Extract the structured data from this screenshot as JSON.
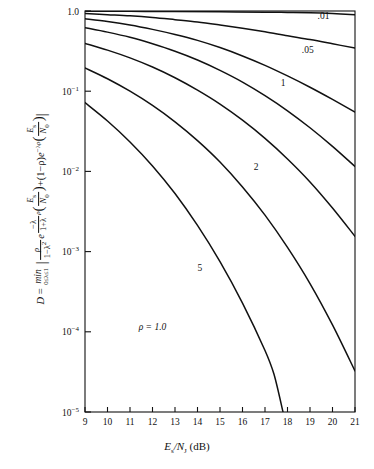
{
  "chart_data": {
    "type": "line",
    "title": "",
    "xlabel": "Es/NJ (dB)",
    "ylabel": "D = min 0<=lambda<=1 | rho/(1-lambda^2) e^{-(lambda/(1+lambda)) rho (Es/N0)} + (1-rho) e^{-lambda rho (Es/N0)} |",
    "xscale": "linear",
    "yscale": "log",
    "xlim": [
      9,
      21
    ],
    "ylim": [
      1e-05,
      1.0
    ],
    "grid": false,
    "legend_position": "inline-curve-labels",
    "xticks": [
      9,
      10,
      11,
      12,
      13,
      14,
      15,
      16,
      17,
      18,
      19,
      20,
      21
    ],
    "xticklabels": [
      "9",
      "10",
      "11",
      "12",
      "13",
      "14",
      "15",
      "16",
      "17",
      "18",
      "19",
      "20",
      "21"
    ],
    "yticks": [
      1.0,
      0.1,
      0.01,
      0.001,
      0.0001,
      1e-05
    ],
    "yticklabels": [
      "1.0",
      "10-1",
      "10-2",
      "10-3",
      "10-4",
      "10-5"
    ],
    "parameter_symbol": "rho",
    "series": [
      {
        "name": "top",
        "label": "",
        "rho": null,
        "points": [
          [
            9,
            0.995
          ],
          [
            11,
            0.99
          ],
          [
            13,
            0.985
          ],
          [
            15,
            0.978
          ],
          [
            17,
            0.968
          ],
          [
            18,
            0.96
          ],
          [
            19,
            0.95
          ],
          [
            20,
            0.93
          ],
          [
            21,
            0.9
          ]
        ]
      },
      {
        "name": ".01",
        "label": ".01",
        "rho": 0.01,
        "label_x": 19.6,
        "label_y": 0.8,
        "points": [
          [
            9,
            0.93
          ],
          [
            10,
            0.9
          ],
          [
            11,
            0.87
          ],
          [
            12,
            0.83
          ],
          [
            13,
            0.78
          ],
          [
            14,
            0.73
          ],
          [
            15,
            0.67
          ],
          [
            16,
            0.61
          ],
          [
            17,
            0.55
          ],
          [
            18,
            0.49
          ],
          [
            19,
            0.44
          ],
          [
            20,
            0.39
          ],
          [
            21,
            0.345
          ]
        ]
      },
      {
        "name": ".05",
        "label": ".05",
        "rho": 0.05,
        "label_x": 18.9,
        "label_y": 0.3,
        "points": [
          [
            9,
            0.8
          ],
          [
            10,
            0.74
          ],
          [
            11,
            0.67
          ],
          [
            12,
            0.59
          ],
          [
            13,
            0.51
          ],
          [
            14,
            0.43
          ],
          [
            15,
            0.35
          ],
          [
            16,
            0.275
          ],
          [
            17,
            0.21
          ],
          [
            18,
            0.155
          ],
          [
            19,
            0.112
          ],
          [
            20,
            0.079
          ],
          [
            21,
            0.055
          ]
        ]
      },
      {
        "name": ".1",
        "label": "1",
        "rho": 0.1,
        "label_x": 17.8,
        "label_y": 0.115,
        "points": [
          [
            9,
            0.62
          ],
          [
            10,
            0.545
          ],
          [
            11,
            0.47
          ],
          [
            12,
            0.39
          ],
          [
            13,
            0.315
          ],
          [
            14,
            0.245
          ],
          [
            15,
            0.182
          ],
          [
            16,
            0.13
          ],
          [
            17,
            0.088
          ],
          [
            18,
            0.057
          ],
          [
            19,
            0.035
          ],
          [
            20,
            0.0205
          ],
          [
            21,
            0.0115
          ]
        ]
      },
      {
        "name": ".2",
        "label": "2",
        "rho": 0.2,
        "label_x": 16.6,
        "label_y": 0.0105,
        "points": [
          [
            9,
            0.395
          ],
          [
            10,
            0.325
          ],
          [
            11,
            0.26
          ],
          [
            12,
            0.2
          ],
          [
            13,
            0.147
          ],
          [
            14,
            0.103
          ],
          [
            15,
            0.069
          ],
          [
            16,
            0.0435
          ],
          [
            17,
            0.0258
          ],
          [
            18,
            0.0143
          ],
          [
            19,
            0.0074
          ],
          [
            20,
            0.0035
          ],
          [
            21,
            0.00155
          ]
        ]
      },
      {
        "name": ".5",
        "label": "5",
        "rho": 0.5,
        "label_x": 14.1,
        "label_y": 0.00058,
        "points": [
          [
            9,
            0.195
          ],
          [
            10,
            0.143
          ],
          [
            11,
            0.1
          ],
          [
            12,
            0.0665
          ],
          [
            13,
            0.0415
          ],
          [
            14,
            0.0242
          ],
          [
            15,
            0.0131
          ],
          [
            16,
            0.0064
          ],
          [
            17,
            0.00285
          ],
          [
            18,
            0.00113
          ],
          [
            19,
            0.0004
          ],
          [
            20,
            0.000122
          ],
          [
            21,
            3.25e-05
          ]
        ]
      },
      {
        "name": "1.0",
        "label": "",
        "rho": 1.0,
        "points": [
          [
            9,
            0.072
          ],
          [
            10,
            0.0425
          ],
          [
            11,
            0.0233
          ],
          [
            12,
            0.0117
          ],
          [
            13,
            0.0053
          ],
          [
            14,
            0.00212
          ],
          [
            15,
            0.00075
          ],
          [
            16,
            0.000228
          ],
          [
            17,
            5.85e-05
          ],
          [
            17.4,
            2.95e-05
          ],
          [
            17.8,
            1e-05
          ]
        ]
      }
    ],
    "annotations": [
      {
        "text": "ρ = 1.0",
        "x": 12.0,
        "y": 0.000105
      }
    ]
  },
  "axis": {
    "x_title_main": "E",
    "x_title_sub1": "s",
    "x_title_slash": "/N",
    "x_title_sub2": "J",
    "x_title_units": "(dB)"
  },
  "ylabel_parts": {
    "d_sym": "D",
    "eq": "=",
    "min_word": "min",
    "min_range": "0≤λ≤1",
    "rho": "ρ",
    "one_minus": "1−λ",
    "sq": "2",
    "e_sym": "e",
    "exp1_num": "−λ",
    "exp1_den": "1+λ",
    "rho2": "ρ",
    "es": "E",
    "s_sub": "s",
    "n0": "N",
    "zero_sub": "0",
    "plus": "+",
    "one_minus_rho": "(1−ρ)",
    "e2": "e",
    "exp2": "−λρ",
    "es2": "E",
    "s_sub2": "s",
    "n02": "N",
    "zero_sub2": "0"
  },
  "colors": {
    "axis": "#111111",
    "curve": "#111111",
    "background": "#ffffff"
  }
}
